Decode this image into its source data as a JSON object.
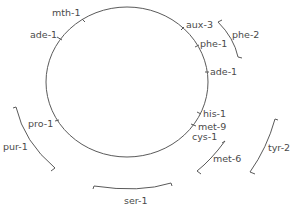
{
  "diagram": {
    "type": "circular genetic map",
    "chromosome": {
      "shape": "circle"
    },
    "markers": [
      {
        "label": "mth-1"
      },
      {
        "label": "ade-1"
      },
      {
        "label": "aux-3"
      },
      {
        "label": "phe-1"
      },
      {
        "label": "ade-1"
      },
      {
        "label": "his-1"
      },
      {
        "label": "met-9"
      },
      {
        "label": "cys-1"
      },
      {
        "label": "pro-1"
      }
    ],
    "regions": [
      {
        "label": "phe-2"
      },
      {
        "label": "tyr-2"
      },
      {
        "label": "met-6"
      },
      {
        "label": "ser-1"
      },
      {
        "label": "pur-1"
      }
    ]
  }
}
